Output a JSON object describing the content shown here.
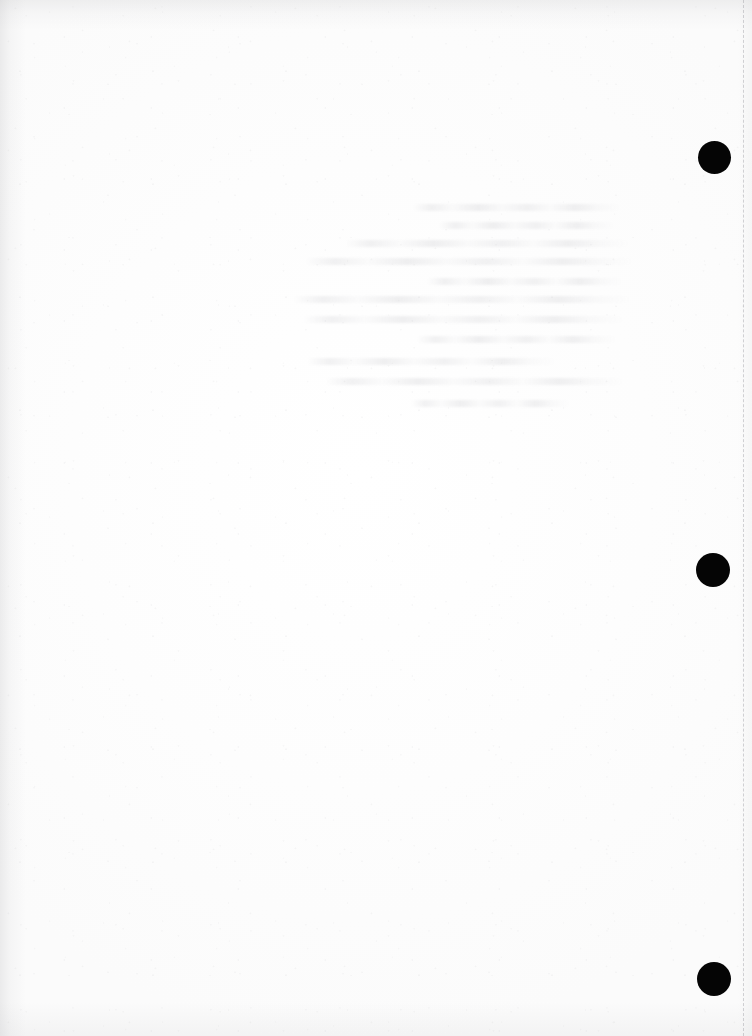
{
  "document": {
    "kind": "scanned-page",
    "page_width": 752,
    "page_height": 1036,
    "background_color": "#fefefe",
    "ink_color": "#050505",
    "visible_text": "",
    "note": ""
  },
  "margin_marks": {
    "name": "registration-dots",
    "shape": "filled-circle",
    "color": "#050505",
    "count": 3,
    "dots": [
      {
        "label": "registration-dot-top",
        "x": 714,
        "y": 157,
        "diameter": 33
      },
      {
        "label": "registration-dot-middle",
        "x": 713,
        "y": 570,
        "diameter": 34
      },
      {
        "label": "registration-dot-bottom",
        "x": 714,
        "y": 979,
        "diameter": 34
      }
    ]
  },
  "guide_line": {
    "name": "dashed-margin-guide",
    "orientation": "vertical",
    "x": 743,
    "color": "#a5a5ac",
    "style": "dashed"
  },
  "bleed_through": {
    "name": "ghost-text-region",
    "legible": false,
    "x": 285,
    "y": 198,
    "width": 358,
    "height": 222,
    "color": "#96969e",
    "lines": [
      {
        "top": 6,
        "left": 128,
        "width": 208
      },
      {
        "top": 24,
        "left": 154,
        "width": 176
      },
      {
        "top": 42,
        "left": 60,
        "width": 286
      },
      {
        "top": 60,
        "left": 20,
        "width": 330
      },
      {
        "top": 80,
        "left": 142,
        "width": 196
      },
      {
        "top": 98,
        "left": 8,
        "width": 340
      },
      {
        "top": 118,
        "left": 18,
        "width": 322
      },
      {
        "top": 138,
        "left": 132,
        "width": 200
      },
      {
        "top": 160,
        "left": 22,
        "width": 250
      },
      {
        "top": 180,
        "left": 40,
        "width": 300
      },
      {
        "top": 202,
        "left": 126,
        "width": 160
      }
    ]
  }
}
